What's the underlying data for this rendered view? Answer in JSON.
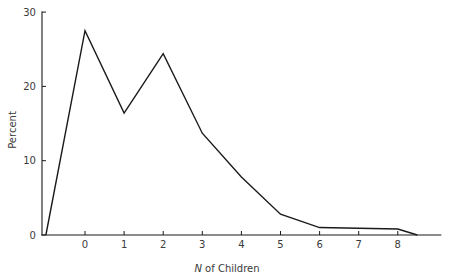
{
  "chart_data": {
    "type": "line",
    "title": "",
    "subtitle": "",
    "xlabel": "N of Children",
    "xlabel_italic_prefix": "N",
    "xlabel_rest": " of Children",
    "ylabel": "Percent",
    "x": [
      -1,
      0,
      1,
      2,
      3,
      4,
      5,
      6,
      7,
      8,
      8.5
    ],
    "values": [
      0,
      27.5,
      16.4,
      24.4,
      13.7,
      7.8,
      2.8,
      1.0,
      0.9,
      0.8,
      0
    ],
    "series": [
      {
        "name": "Percent",
        "values": [
          0,
          27.5,
          16.4,
          24.4,
          13.7,
          7.8,
          2.8,
          1.0,
          0.9,
          0.8,
          0
        ]
      }
    ],
    "xticks": [
      0,
      1,
      2,
      3,
      4,
      5,
      6,
      7,
      8
    ],
    "xtick_labels": [
      "0",
      "1",
      "2",
      "3",
      "4",
      "5",
      "6",
      "7",
      "8"
    ],
    "yticks": [
      0,
      10,
      20,
      30
    ],
    "ytick_labels": [
      "0",
      "10",
      "20",
      "30"
    ],
    "xlim": [
      -1.1,
      9.1
    ],
    "ylim": [
      0,
      30
    ],
    "grid": false,
    "legend": "none",
    "line_color": "#1a1a1a",
    "axis_color": "#1a1a1a",
    "background": "#ffffff"
  }
}
